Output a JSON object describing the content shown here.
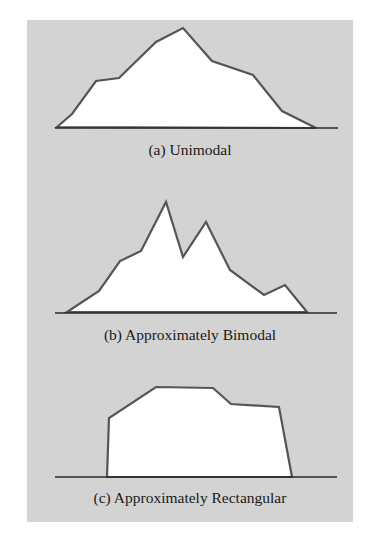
{
  "colors": {
    "background": "#ffffff",
    "panel": "#d3d3d3",
    "outline": "#555555",
    "fill": "#ffffff",
    "baseline": "#2a2a2a"
  },
  "figures": [
    {
      "id": "a",
      "caption": "(a) Unimodal",
      "baseline": {
        "x1": 55,
        "x2": 338,
        "y": 128
      },
      "points": [
        [
          57,
          127
        ],
        [
          72,
          114
        ],
        [
          96,
          81
        ],
        [
          119,
          78
        ],
        [
          156,
          42
        ],
        [
          183,
          28
        ],
        [
          212,
          61
        ],
        [
          253,
          75
        ],
        [
          282,
          111
        ],
        [
          316,
          128
        ]
      ]
    },
    {
      "id": "b",
      "caption": "(b) Approximately Bimodal",
      "baseline": {
        "x1": 55,
        "x2": 337,
        "y": 313
      },
      "points": [
        [
          67,
          312
        ],
        [
          99,
          291
        ],
        [
          120,
          261
        ],
        [
          141,
          251
        ],
        [
          166,
          202
        ],
        [
          183,
          257
        ],
        [
          206,
          222
        ],
        [
          230,
          270
        ],
        [
          264,
          295
        ],
        [
          285,
          285
        ],
        [
          307,
          312
        ]
      ]
    },
    {
      "id": "c",
      "caption": "(c) Approximately Rectangular",
      "baseline": {
        "x1": 55,
        "x2": 337,
        "y": 477
      },
      "points": [
        [
          107,
          477
        ],
        [
          109,
          418
        ],
        [
          156,
          387
        ],
        [
          213,
          388
        ],
        [
          231,
          404
        ],
        [
          279,
          407
        ],
        [
          292,
          477
        ]
      ]
    }
  ]
}
